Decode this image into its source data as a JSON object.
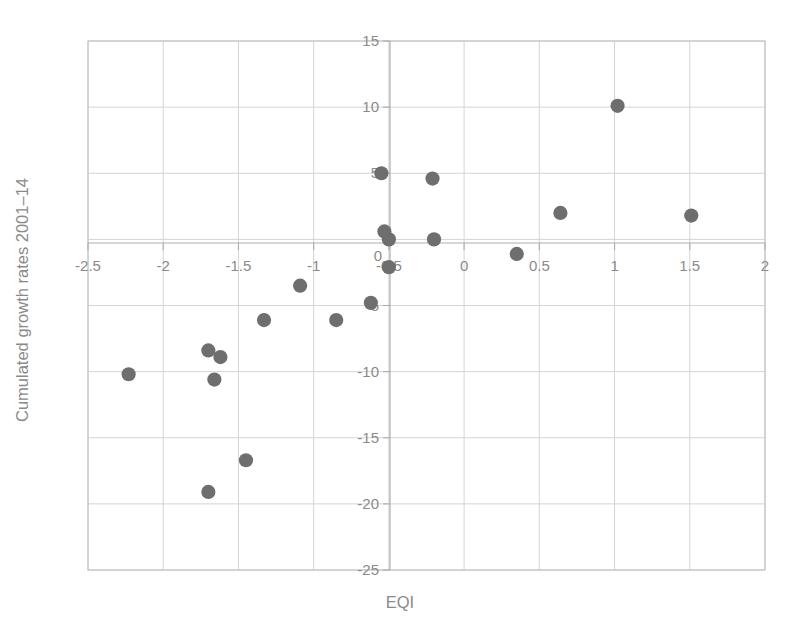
{
  "chart_data": {
    "type": "scatter",
    "title": "",
    "xlabel": "EQI",
    "ylabel": "Cumulated growth rates 2001–14",
    "xlim": [
      -2.5,
      2
    ],
    "ylim": [
      -25,
      15
    ],
    "xticks": [
      "-2.5",
      "-2",
      "-1.5",
      "-1",
      "-0.5",
      "0",
      "0.5",
      "1",
      "1.5",
      "2"
    ],
    "xtick_values": [
      -2.5,
      -2,
      -1.5,
      -1,
      -0.5,
      0,
      0.5,
      1,
      1.5,
      2
    ],
    "yticks": [
      "15",
      "10",
      "5",
      "0",
      "-5",
      "-10",
      "-15",
      "-20",
      "-25"
    ],
    "ytick_values": [
      15,
      10,
      5,
      0,
      -5,
      -10,
      -15,
      -20,
      -25
    ],
    "grid": true,
    "legend": null,
    "marker": {
      "shape": "circle",
      "color": "#6e6e6e",
      "size": 9
    },
    "points": [
      {
        "x": -2.23,
        "y": -10.2
      },
      {
        "x": -1.7,
        "y": -8.4
      },
      {
        "x": -1.62,
        "y": -8.9
      },
      {
        "x": -1.66,
        "y": -10.6
      },
      {
        "x": -1.7,
        "y": -19.1
      },
      {
        "x": -1.45,
        "y": -16.7
      },
      {
        "x": -1.33,
        "y": -6.1
      },
      {
        "x": -1.09,
        "y": -3.5
      },
      {
        "x": -0.85,
        "y": -6.1
      },
      {
        "x": -0.62,
        "y": -4.8
      },
      {
        "x": -0.55,
        "y": 5.0
      },
      {
        "x": -0.53,
        "y": 0.6
      },
      {
        "x": -0.5,
        "y": 0.0
      },
      {
        "x": -0.5,
        "y": -2.1
      },
      {
        "x": -0.21,
        "y": 4.6
      },
      {
        "x": -0.2,
        "y": 0.0
      },
      {
        "x": 0.35,
        "y": -1.1
      },
      {
        "x": 0.64,
        "y": 2.0
      },
      {
        "x": 1.02,
        "y": 10.1
      },
      {
        "x": 1.51,
        "y": 1.8
      }
    ]
  },
  "colors": {
    "marker": "#6e6e6e",
    "grid": "#c9c9c9",
    "frame": "#c2c2c2",
    "axis": "#adadad",
    "text": "#8a8a8a",
    "background": "#ffffff"
  }
}
